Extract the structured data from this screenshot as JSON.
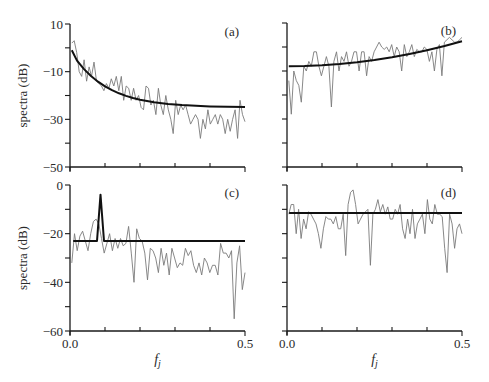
{
  "figure": {
    "colors": {
      "periodogram": "#7a7a7a",
      "fit": "#111111",
      "axis": "#1a1a1a"
    }
  },
  "chart_data": [
    {
      "type": "line",
      "panel": "(a)",
      "xlabel": "",
      "ylabel": "spectra (dB)",
      "xlim": [
        0.0,
        0.5
      ],
      "ylim": [
        -50,
        10
      ],
      "yticks": [
        -50,
        -40,
        -30,
        -20,
        -10,
        0,
        10
      ],
      "ytick_labels": [
        {
          "value": 10,
          "label": "10"
        },
        {
          "value": -10,
          "label": "−10"
        },
        {
          "value": -30,
          "label": "−30"
        },
        {
          "value": -50,
          "label": "−50"
        }
      ],
      "xticks": [
        0.0,
        0.1,
        0.2,
        0.3,
        0.4,
        0.5
      ],
      "xtick_labels": [],
      "grid": false,
      "series": [
        {
          "name": "periodogram",
          "x_range": [
            0.005,
            0.5
          ],
          "values": [
            2,
            3,
            -2,
            -10,
            -12,
            -5,
            -14,
            -8,
            -12,
            -6,
            -14,
            -15,
            -16,
            -18,
            -15,
            -17,
            -13,
            -16,
            -12,
            -18,
            -12,
            -22,
            -16,
            -17,
            -22,
            -17,
            -22,
            -20,
            -25,
            -26,
            -16,
            -17,
            -24,
            -22,
            -28,
            -17,
            -24,
            -28,
            -20,
            -26,
            -30,
            -36,
            -22,
            -28,
            -24,
            -26,
            -24,
            -28,
            -32,
            -30,
            -28,
            -30,
            -38,
            -30,
            -34,
            -26,
            -32,
            -30,
            -28,
            -32,
            -28,
            -30,
            -36,
            -30,
            -35,
            -30,
            -26,
            -38,
            -22,
            -28,
            -31
          ]
        },
        {
          "name": "fitted spectrum",
          "x": [
            0.005,
            0.02,
            0.04,
            0.06,
            0.08,
            0.1,
            0.12,
            0.14,
            0.16,
            0.18,
            0.2,
            0.24,
            0.28,
            0.32,
            0.36,
            0.4,
            0.45,
            0.5
          ],
          "values": [
            -1.0,
            -5.35,
            -8.91,
            -11.83,
            -14.22,
            -16.17,
            -17.77,
            -19.08,
            -20.15,
            -21.03,
            -21.75,
            -22.82,
            -23.54,
            -24.02,
            -24.34,
            -24.56,
            -24.73,
            -24.84
          ]
        }
      ]
    },
    {
      "type": "line",
      "panel": "(b)",
      "xlabel": "",
      "ylabel": "",
      "xlim": [
        0.0,
        0.5
      ],
      "ylim": [
        -50,
        10
      ],
      "yticks": [
        -50,
        -40,
        -30,
        -20,
        -10,
        0,
        10
      ],
      "ytick_labels": [],
      "xticks": [
        0.0,
        0.1,
        0.2,
        0.3,
        0.4,
        0.5
      ],
      "xtick_labels": [],
      "grid": false,
      "series": [
        {
          "name": "periodogram",
          "x_range": [
            0.005,
            0.5
          ],
          "values": [
            -14,
            -28,
            -10,
            -14,
            -16,
            -23,
            -8,
            -10,
            -6,
            -8,
            -2,
            -2,
            -8,
            -12,
            -8,
            -4,
            -8,
            -25,
            -6,
            -2,
            -10,
            -4,
            -6,
            -2,
            -8,
            -6,
            -2,
            -2,
            -10,
            -2,
            -2,
            -12,
            -4,
            -6,
            -2,
            0,
            2,
            0,
            -1,
            0,
            -2,
            1,
            -4,
            0,
            -2,
            -10,
            1,
            -4,
            -2,
            1,
            -4,
            -1,
            -2,
            -2,
            0,
            -1,
            -6,
            -2,
            -10,
            -1,
            1,
            -12,
            2,
            3,
            4,
            3,
            2,
            2,
            3,
            4
          ]
        },
        {
          "name": "fitted spectrum",
          "x": [
            0.005,
            0.05,
            0.1,
            0.15,
            0.2,
            0.25,
            0.3,
            0.35,
            0.4,
            0.45,
            0.5
          ],
          "values": [
            -8.0,
            -7.9,
            -7.58,
            -7.06,
            -6.34,
            -5.4,
            -4.26,
            -2.9,
            -1.34,
            0.42,
            2.4
          ]
        }
      ]
    },
    {
      "type": "line",
      "panel": "(c)",
      "xlabel": "f_j",
      "ylabel": "spectra (dB)",
      "xlim": [
        0.0,
        0.5
      ],
      "ylim": [
        -60,
        0
      ],
      "yticks": [
        -60,
        -50,
        -40,
        -30,
        -20,
        -10,
        0
      ],
      "ytick_labels": [
        {
          "value": 0,
          "label": "0"
        },
        {
          "value": -20,
          "label": "−20"
        },
        {
          "value": -40,
          "label": "−40"
        },
        {
          "value": -60,
          "label": "−60"
        }
      ],
      "xticks": [
        0.0,
        0.1,
        0.2,
        0.3,
        0.4,
        0.5
      ],
      "xtick_labels": [
        {
          "value": 0.0,
          "label": "0.0"
        },
        {
          "value": 0.5,
          "label": "0.5"
        }
      ],
      "grid": false,
      "series": [
        {
          "name": "periodogram",
          "x_range": [
            0.005,
            0.5
          ],
          "values": [
            -32,
            -20,
            -27,
            -21,
            -19,
            -23,
            -27,
            -20,
            -15,
            -14,
            -16,
            -22,
            -28,
            -24,
            -20,
            -27,
            -22,
            -26,
            -22,
            -25,
            -24,
            -17,
            -28,
            -40,
            -18,
            -22,
            -23,
            -28,
            -39,
            -26,
            -27,
            -30,
            -36,
            -26,
            -33,
            -28,
            -37,
            -26,
            -30,
            -34,
            -32,
            -33,
            -26,
            -29,
            -27,
            -33,
            -36,
            -32,
            -37,
            -30,
            -32,
            -36,
            -33,
            -33,
            -37,
            -24,
            -28,
            -28,
            -30,
            -27,
            -55,
            -32,
            -25,
            -43,
            -36
          ]
        },
        {
          "name": "fitted spectrum",
          "x": [
            0.009,
            0.077,
            0.087,
            0.097,
            0.5
          ],
          "values": [
            -23,
            -23,
            -4,
            -23,
            -23
          ]
        }
      ]
    },
    {
      "type": "line",
      "panel": "(d)",
      "xlabel": "f_j",
      "ylabel": "",
      "xlim": [
        0.0,
        0.5
      ],
      "ylim": [
        -60,
        0
      ],
      "yticks": [
        -60,
        -50,
        -40,
        -30,
        -20,
        -10,
        0
      ],
      "ytick_labels": [],
      "xticks": [
        0.0,
        0.1,
        0.2,
        0.3,
        0.4,
        0.5
      ],
      "xtick_labels": [
        {
          "value": 0.0,
          "label": "0.0"
        },
        {
          "value": 0.5,
          "label": "0.5"
        }
      ],
      "grid": false,
      "series": [
        {
          "name": "periodogram",
          "x_range": [
            0.005,
            0.5
          ],
          "values": [
            -12,
            -8,
            -8,
            -20,
            -10,
            -22,
            -14,
            -18,
            -11,
            -12,
            -14,
            -16,
            -20,
            -26,
            -18,
            -13,
            -14,
            -14,
            -16,
            -13,
            -18,
            -18,
            -12,
            -29,
            -8,
            -3,
            -2,
            -8,
            -16,
            -14,
            -12,
            -11,
            -10,
            -33,
            -12,
            -10,
            -6,
            -11,
            -8,
            -12,
            -9,
            -14,
            -14,
            -10,
            -12,
            -8,
            -18,
            -22,
            -14,
            -20,
            -10,
            -22,
            -16,
            -14,
            -12,
            -20,
            -6,
            -14,
            -16,
            -8,
            -12,
            -12,
            -13,
            -26,
            -36,
            -12,
            -16,
            -26,
            -18,
            -16,
            -20
          ]
        },
        {
          "name": "fitted spectrum",
          "x": [
            0.006,
            0.5
          ],
          "values": [
            -11.5,
            -11.5
          ]
        }
      ]
    }
  ]
}
